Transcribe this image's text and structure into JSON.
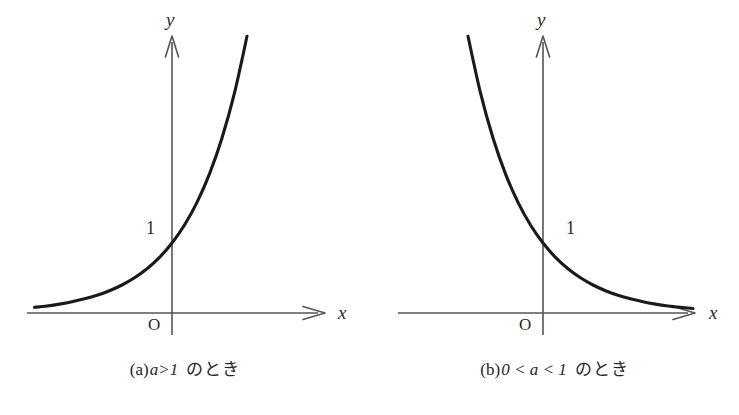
{
  "figure": {
    "background_color": "#ffffff",
    "axis_color": "#4a4a4a",
    "curve_color": "#1a1a1a"
  },
  "panels": [
    {
      "id": "a",
      "axis_x_label": "x",
      "axis_y_label": "y",
      "origin_label": "O",
      "tick_label": "1",
      "caption_tag": "(a)",
      "caption_math": "a>1",
      "caption_jp": "のとき",
      "caption_full": "(a) a>1 のとき"
    },
    {
      "id": "b",
      "axis_x_label": "x",
      "axis_y_label": "y",
      "origin_label": "O",
      "tick_label": "1",
      "caption_tag": "(b)",
      "caption_math": "0 < a < 1",
      "caption_jp": "のとき",
      "caption_full": "(b) 0 < a < 1 のとき"
    }
  ],
  "chart_data": [
    {
      "type": "line",
      "title": "(a) a>1 のとき",
      "xlabel": "x",
      "ylabel": "y",
      "grid": false,
      "legend": "none",
      "xlim": [
        -3.0,
        2.35
      ],
      "ylim": [
        -0.25,
        7.4
      ],
      "annotations": [
        {
          "text": "1",
          "x": -0.32,
          "y": 1.0,
          "note": "y-intercept tick label, left of y-axis"
        },
        {
          "text": "O",
          "x": -0.28,
          "y": -0.18,
          "note": "origin label"
        }
      ],
      "series": [
        {
          "name": "y = a^x (a > 1)",
          "function": "y = 2.5^x",
          "x": [
            -3.0,
            -2.75,
            -2.5,
            -2.25,
            -2.0,
            -1.75,
            -1.5,
            -1.25,
            -1.0,
            -0.75,
            -0.5,
            -0.25,
            0.0,
            0.25,
            0.5,
            0.75,
            1.0,
            1.25,
            1.5,
            1.75,
            2.0,
            2.1,
            2.2,
            2.3
          ],
          "y": [
            0.064,
            0.081,
            0.101,
            0.127,
            0.16,
            0.202,
            0.253,
            0.318,
            0.4,
            0.503,
            0.632,
            0.795,
            1.0,
            1.257,
            1.581,
            1.988,
            2.5,
            3.144,
            3.953,
            4.971,
            6.25,
            6.85,
            7.51,
            8.23
          ]
        }
      ]
    },
    {
      "type": "line",
      "title": "(b) 0 < a < 1 のとき",
      "xlabel": "x",
      "ylabel": "y",
      "grid": false,
      "legend": "none",
      "xlim": [
        -2.35,
        3.0
      ],
      "ylim": [
        -0.25,
        7.4
      ],
      "annotations": [
        {
          "text": "1",
          "x": 0.35,
          "y": 1.0,
          "note": "y-intercept tick label, right of y-axis"
        },
        {
          "text": "O",
          "x": -0.28,
          "y": -0.18,
          "note": "origin label"
        }
      ],
      "series": [
        {
          "name": "y = a^x (0 < a < 1)",
          "function": "y = 0.4^x",
          "x": [
            -2.3,
            -2.2,
            -2.1,
            -2.0,
            -1.75,
            -1.5,
            -1.25,
            -1.0,
            -0.75,
            -0.5,
            -0.25,
            0.0,
            0.25,
            0.5,
            0.75,
            1.0,
            1.25,
            1.5,
            1.75,
            2.0,
            2.25,
            2.5,
            2.75,
            3.0
          ],
          "y": [
            8.23,
            7.51,
            6.85,
            6.25,
            4.971,
            3.953,
            3.144,
            2.5,
            1.988,
            1.581,
            1.257,
            1.0,
            0.795,
            0.632,
            0.503,
            0.4,
            0.318,
            0.253,
            0.202,
            0.16,
            0.127,
            0.101,
            0.081,
            0.064
          ]
        }
      ]
    }
  ]
}
